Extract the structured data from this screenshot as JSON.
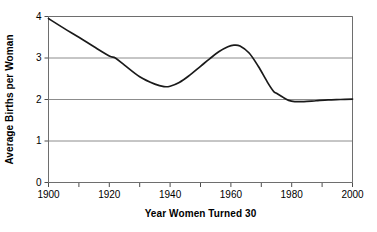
{
  "chart_data": {
    "type": "line",
    "title": "",
    "xlabel": "Year Women Turned 30",
    "ylabel": "Average Births per Woman",
    "xlim": [
      1900,
      2000
    ],
    "ylim": [
      0,
      4
    ],
    "grid": true,
    "legend": false,
    "line_color": "#1a1a1a",
    "grid_color": "#8c8c8c",
    "axis_color": "#6e6e6e",
    "background": "#ffffff",
    "xticks": [
      1900,
      1910,
      1920,
      1930,
      1940,
      1950,
      1960,
      1970,
      1980,
      1990,
      2000
    ],
    "xtick_labels": [
      "1900",
      "",
      "1920",
      "",
      "1940",
      "",
      "1960",
      "",
      "1980",
      "",
      "2000"
    ],
    "xtick_major_labels": [
      "1900",
      "1920",
      "1940",
      "1960",
      "1980",
      "2000"
    ],
    "xtick_major_values": [
      1900,
      1920,
      1940,
      1960,
      1980,
      2000
    ],
    "yticks": [
      0,
      1,
      2,
      3,
      4
    ],
    "ytick_labels": [
      "0",
      "1",
      "2",
      "3",
      "4"
    ],
    "series": [
      {
        "name": "Average births per woman",
        "x": [
          1900,
          1905,
          1910,
          1915,
          1920,
          1922,
          1925,
          1930,
          1935,
          1938,
          1940,
          1943,
          1946,
          1950,
          1953,
          1956,
          1959,
          1961,
          1963,
          1966,
          1969,
          1972,
          1974,
          1975,
          1977,
          1979,
          1981,
          1984,
          1988,
          1992,
          1996,
          2000
        ],
        "y": [
          3.95,
          3.72,
          3.5,
          3.27,
          3.05,
          3.0,
          2.83,
          2.55,
          2.37,
          2.31,
          2.32,
          2.41,
          2.56,
          2.8,
          2.98,
          3.15,
          3.27,
          3.31,
          3.29,
          3.12,
          2.8,
          2.42,
          2.2,
          2.15,
          2.06,
          1.98,
          1.95,
          1.95,
          1.97,
          1.99,
          2.0,
          2.01
        ]
      }
    ],
    "annotations": []
  }
}
